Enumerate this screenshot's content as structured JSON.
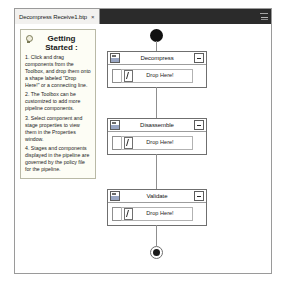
{
  "window": {
    "tab": {
      "label": "Decompress Receive1.btp",
      "close_icon": "close-icon",
      "close_glyph": "×"
    },
    "overflow_icon": "tab-overflow-icon"
  },
  "getting_started": {
    "icon": "lightbulb-icon",
    "title": "Getting Started :",
    "steps": [
      "1. Click and drag components from the Toolbox, and drop them onto a shape labeled \"Drop Here!\" or a connecting line.",
      "2. The Toolbox can be customized to add more pipeline components.",
      "3. Select component and stage properties to view them in the Properties window.",
      "4. Stages and components displayed in the pipeline are governed by the policy file for the pipeline."
    ]
  },
  "pipeline": {
    "start_node": "start-node",
    "end_node": "end-node",
    "drop_label": "Drop Here!",
    "stages": [
      {
        "name": "Decompress",
        "icon": "stage-icon",
        "collapse_icon": "collapse-icon",
        "drop_label": "Drop Here!",
        "drop_icon": "component-drop-icon"
      },
      {
        "name": "Disassemble",
        "icon": "stage-icon",
        "collapse_icon": "collapse-icon",
        "drop_label": "Drop Here!",
        "drop_icon": "component-drop-icon"
      },
      {
        "name": "Validate",
        "icon": "stage-icon",
        "collapse_icon": "collapse-icon",
        "drop_label": "Drop Here!",
        "drop_icon": "component-drop-icon"
      }
    ]
  }
}
